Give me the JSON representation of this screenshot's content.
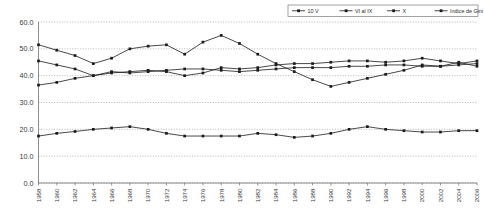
{
  "chart_data": {
    "type": "line",
    "title": "",
    "xlabel": "",
    "ylabel": "",
    "ylim": [
      0.0,
      60.0
    ],
    "grid": true,
    "legend_position": "top-right",
    "ytick_labels": [
      "60.0",
      "50.0",
      "40.0",
      "30.0",
      "20.0",
      "10.0",
      "0.0"
    ],
    "ytick_values": [
      60.0,
      50.0,
      40.0,
      30.0,
      20.0,
      10.0,
      0.0
    ],
    "categories": [
      "1958",
      "1960",
      "1962",
      "1964",
      "1966",
      "1968",
      "1970",
      "1972",
      "1974",
      "1976",
      "1978",
      "1980",
      "1982",
      "1984",
      "1986",
      "1988",
      "1990",
      "1992",
      "1994",
      "1996",
      "1998",
      "2000",
      "2002",
      "2004",
      "2006"
    ],
    "series": [
      {
        "name": "10 V",
        "marker": "square",
        "values": [
          51.5,
          49.5,
          47.5,
          44.5,
          46.5,
          50.0,
          51.0,
          51.5,
          48.0,
          52.5,
          55.0,
          52.0,
          48.0,
          44.5,
          41.5,
          38.5,
          36.0,
          37.5,
          39.0,
          40.5,
          42.0,
          44.0,
          43.5,
          45.0,
          43.5
        ]
      },
      {
        "name": "VI al IX",
        "marker": "square",
        "values": [
          45.5,
          44.0,
          42.5,
          40.0,
          41.0,
          41.5,
          42.0,
          41.5,
          40.0,
          41.0,
          43.0,
          42.5,
          43.0,
          44.0,
          44.5,
          44.5,
          45.0,
          45.5,
          45.5,
          45.0,
          45.5,
          46.5,
          45.5,
          44.5,
          45.5
        ]
      },
      {
        "name": "X",
        "marker": "square",
        "values": [
          36.5,
          37.5,
          39.0,
          40.0,
          41.5,
          41.0,
          41.5,
          42.0,
          42.5,
          42.5,
          42.0,
          41.5,
          42.0,
          42.5,
          43.0,
          43.0,
          43.0,
          43.5,
          43.5,
          44.0,
          44.0,
          43.5,
          43.5,
          44.0,
          44.5
        ]
      },
      {
        "name": "Indice de Gini",
        "marker": "square",
        "values": [
          17.5,
          18.5,
          19.2,
          20.0,
          20.5,
          21.0,
          20.0,
          18.5,
          17.5,
          17.5,
          17.5,
          17.5,
          18.5,
          18.0,
          17.0,
          17.5,
          18.5,
          20.0,
          21.0,
          20.0,
          19.5,
          19.0,
          19.0,
          19.5,
          19.5
        ]
      }
    ]
  },
  "legend": {
    "entries": [
      {
        "label": "10 V"
      },
      {
        "label": "VI al IX"
      },
      {
        "label": "X"
      },
      {
        "label": "Indice de Gini"
      }
    ]
  },
  "colors": {
    "series": "#1c1c1c",
    "grid": "#9a9a9a",
    "axis": "#6e6e6e",
    "background": "#ffffff",
    "text": "#3a3a3a"
  }
}
